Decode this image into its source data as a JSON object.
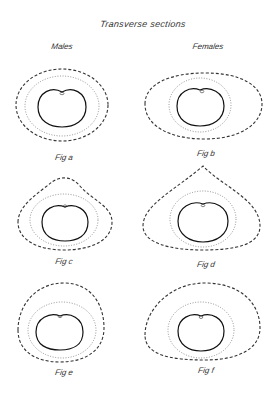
{
  "title": "Transverse sections",
  "columns": {
    "left": "Males",
    "right": "Females"
  },
  "figures": [
    {
      "id": "a",
      "label": "Fig a",
      "group": "Males"
    },
    {
      "id": "b",
      "label": "Fig b",
      "group": "Females"
    },
    {
      "id": "c",
      "label": "Fig c",
      "group": "Males"
    },
    {
      "id": "d",
      "label": "Fig d",
      "group": "Females"
    },
    {
      "id": "e",
      "label": "Fig e",
      "group": "Males"
    },
    {
      "id": "f",
      "label": "Fig f",
      "group": "Females"
    }
  ],
  "legend_styles": {
    "outer_outline": "dashed",
    "middle_outline": "dotted",
    "inner_outline": "solid"
  },
  "colors": {
    "background": "#ffffff",
    "ink": "#222222"
  }
}
